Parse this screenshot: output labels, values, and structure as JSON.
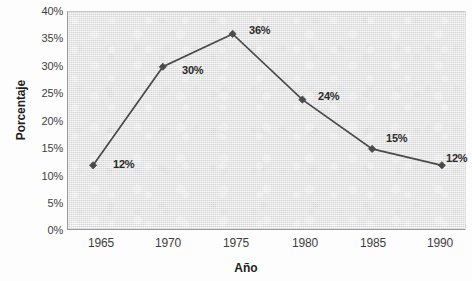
{
  "chart_data": {
    "type": "line",
    "title": "",
    "subtitle": "",
    "xlabel": "Año",
    "ylabel": "Porcentaje",
    "x": [
      1965,
      1970,
      1975,
      1980,
      1985,
      1990
    ],
    "categories": [
      "1965",
      "1970",
      "1975",
      "1980",
      "1985",
      "1990"
    ],
    "values": [
      12,
      30,
      36,
      24,
      15,
      12
    ],
    "point_labels": [
      "12%",
      "30%",
      "36%",
      "24%",
      "15%",
      "12%"
    ],
    "xtick_labels": [
      "1965",
      "1970",
      "1975",
      "1980",
      "1985",
      "1990"
    ],
    "ytick_labels": [
      "0%",
      "5%",
      "10%",
      "15%",
      "20%",
      "25%",
      "30%",
      "35%",
      "40%"
    ],
    "ytick_values": [
      0,
      5,
      10,
      15,
      20,
      25,
      30,
      35,
      40
    ],
    "ylim": [
      0,
      40
    ],
    "xlim": [
      1963.2,
      1991.8
    ],
    "grid": false,
    "legend": null,
    "legend_position": "none",
    "marker": "diamond",
    "series_color": "#4a4a4a",
    "plot_background": "#e9e9e9",
    "figure_background": "#fdfdfd",
    "axis_color": "#9a9a9a",
    "text_color": "#3d3d3d"
  }
}
